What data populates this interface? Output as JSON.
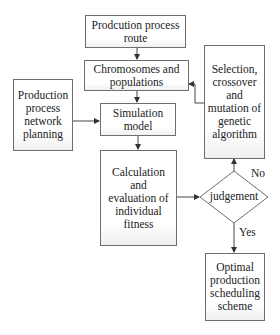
{
  "diagram": {
    "type": "flowchart",
    "nodes": {
      "route": {
        "label": "Prodcution process route"
      },
      "chromosomes": {
        "label": "Chromosomes and populations"
      },
      "network": {
        "label": "Production process network planning"
      },
      "simulation": {
        "label": "Simulation model"
      },
      "fitness": {
        "label": "Calculation and evaluation of individual fitness"
      },
      "genetic": {
        "label": "Selection, crossover and mutation of genetic algorithm"
      },
      "judgement": {
        "label": "judgement",
        "shape": "diamond"
      },
      "optimal": {
        "label": "Optimal production scheduling scheme"
      }
    },
    "edges": [
      {
        "from": "route",
        "to": "chromosomes"
      },
      {
        "from": "chromosomes",
        "to": "simulation"
      },
      {
        "from": "network",
        "to": "simulation"
      },
      {
        "from": "simulation",
        "to": "fitness"
      },
      {
        "from": "fitness",
        "to": "judgement"
      },
      {
        "from": "judgement",
        "to": "genetic",
        "label": "No"
      },
      {
        "from": "genetic",
        "to": "chromosomes"
      },
      {
        "from": "judgement",
        "to": "optimal",
        "label": "Yes"
      }
    ],
    "edge_labels": {
      "no": "No",
      "yes": "Yes"
    }
  }
}
